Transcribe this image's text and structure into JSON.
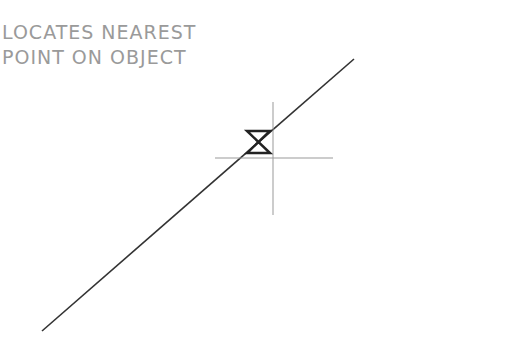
{
  "caption": {
    "line1": "LOCATES NEAREST",
    "line2": "POINT ON OBJECT"
  },
  "diagram": {
    "object_line": {
      "x1": 42,
      "y1": 331,
      "x2": 354,
      "y2": 59,
      "color": "#333333"
    },
    "crosshair": {
      "cx": 273,
      "cy": 158,
      "color": "#999999"
    },
    "nearest_marker": {
      "shape": "hourglass",
      "x": 247,
      "y": 131,
      "w": 23,
      "h": 22,
      "color": "#222222"
    }
  }
}
